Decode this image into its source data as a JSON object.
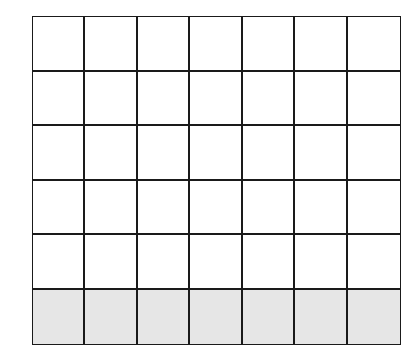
{
  "grid": {
    "rows": 6,
    "columns": 7,
    "shaded_rows": [
      5
    ],
    "colors": {
      "line": "#1a1a1a",
      "empty": "#ffffff",
      "shaded": "#e6e6e6"
    }
  }
}
